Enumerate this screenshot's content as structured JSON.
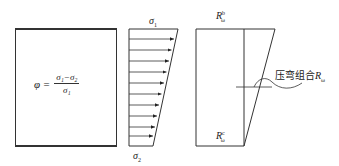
{
  "left_panel": {
    "formula": {
      "lhs": "φ =",
      "numerator": "σ₁−σ₂",
      "denominator": "σ₁"
    }
  },
  "stress_panel": {
    "top_label": "σ",
    "top_label_sub": "1",
    "bottom_label": "σ",
    "bottom_label_sub": "2",
    "arrow_count": 10
  },
  "resistance_panel": {
    "top_label": "R",
    "top_label_sub": "ω",
    "top_label_sup": "b",
    "bottom_label": "R",
    "bottom_label_sub": "ω",
    "bottom_label_sup": "c",
    "callout_text_cn": "压弯组合",
    "callout_symbol": "R",
    "callout_symbol_sub": "ω"
  },
  "colors": {
    "line": "#333333",
    "background": "#ffffff"
  }
}
